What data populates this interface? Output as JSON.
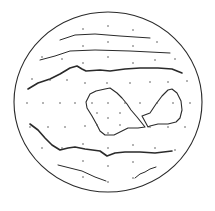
{
  "figure": {
    "width": 215,
    "height": 211,
    "colors": {
      "background": "#ffffff",
      "ink": "#2a2a2a",
      "dot": "#555555"
    },
    "disk": {
      "cx": 108,
      "cy": 102,
      "rx": 94,
      "ry": 90
    },
    "bands": [
      {
        "name": "band-1",
        "weight": 1.0,
        "points": "60,40 75,35 95,34 120,36 150,38"
      },
      {
        "name": "band-2",
        "weight": 1.0,
        "points": "40,60 55,56 70,51 95,50 130,51 170,53"
      },
      {
        "name": "band-3",
        "weight": 1.6,
        "points": "28,89 38,83 50,79 60,74 70,68 77,66 82,69 86,71 100,70 110,71 125,69 140,68 158,68 172,69 182,73"
      },
      {
        "name": "band-4",
        "weight": 1.6,
        "points": "30,124 38,130 45,138 52,145 60,150 68,148 75,147 85,149 100,151 107,156 115,153 125,152 140,152 155,153 172,151"
      },
      {
        "name": "band-5",
        "weight": 1.0,
        "points": "58,165 70,168 82,171 95,177 106,181"
      },
      {
        "name": "band-6",
        "weight": 1.0,
        "points": "135,178 140,174 145,172 150,169 156,167"
      }
    ],
    "spots": [
      {
        "name": "left-spot",
        "points": "86,102 90,94 96,91 105,89 110,88 117,93 122,98 127,104 131,110 137,117 145,127 138,128 128,128 122,131 114,135 105,135 100,131 97,125 92,116 87,108"
      },
      {
        "name": "right-spot",
        "points": "142,116 150,113 156,104 162,96 168,90 172,89 177,93 181,101 182,110 180,118 176,122 168,124 158,124 150,126 148,127 142,116"
      }
    ],
    "dots": [
      [
        83,
        29
      ],
      [
        108,
        26
      ],
      [
        133,
        30
      ],
      [
        83,
        46
      ],
      [
        108,
        42
      ],
      [
        133,
        46
      ],
      [
        157,
        42
      ],
      [
        42,
        57
      ],
      [
        62,
        59
      ],
      [
        83,
        63
      ],
      [
        108,
        57
      ],
      [
        133,
        63
      ],
      [
        155,
        60
      ],
      [
        175,
        59
      ],
      [
        32,
        79
      ],
      [
        50,
        80
      ],
      [
        67,
        80
      ],
      [
        85,
        83
      ],
      [
        107,
        83
      ],
      [
        130,
        83
      ],
      [
        150,
        82
      ],
      [
        168,
        82
      ],
      [
        187,
        81
      ],
      [
        27,
        103
      ],
      [
        43,
        103
      ],
      [
        60,
        103
      ],
      [
        75,
        103
      ],
      [
        92,
        103
      ],
      [
        108,
        103
      ],
      [
        125,
        103
      ],
      [
        140,
        103
      ],
      [
        157,
        103
      ],
      [
        173,
        103
      ],
      [
        190,
        103
      ],
      [
        97,
        113
      ],
      [
        108,
        118
      ],
      [
        120,
        113
      ],
      [
        97,
        125
      ],
      [
        108,
        133
      ],
      [
        120,
        125
      ],
      [
        30,
        127
      ],
      [
        48,
        127
      ],
      [
        65,
        127
      ],
      [
        85,
        126
      ],
      [
        150,
        127
      ],
      [
        168,
        127
      ],
      [
        185,
        127
      ],
      [
        42,
        148
      ],
      [
        62,
        148
      ],
      [
        83,
        144
      ],
      [
        108,
        148
      ],
      [
        133,
        145
      ],
      [
        155,
        148
      ],
      [
        175,
        150
      ],
      [
        83,
        161
      ],
      [
        108,
        166
      ],
      [
        133,
        162
      ],
      [
        83,
        177
      ],
      [
        108,
        182
      ],
      [
        133,
        178
      ]
    ]
  }
}
